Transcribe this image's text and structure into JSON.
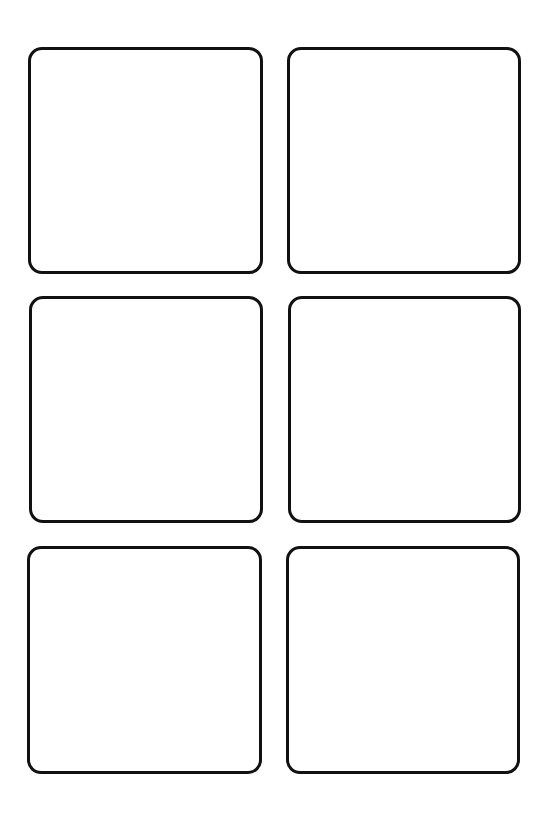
{
  "sheet": {
    "background": "#ffffff",
    "border_color": "#111111",
    "grid": {
      "rows": 3,
      "columns": 2
    },
    "cards": [
      {
        "row": 1,
        "column": 1,
        "label": ""
      },
      {
        "row": 1,
        "column": 2,
        "label": ""
      },
      {
        "row": 2,
        "column": 1,
        "label": ""
      },
      {
        "row": 2,
        "column": 2,
        "label": ""
      },
      {
        "row": 3,
        "column": 1,
        "label": ""
      },
      {
        "row": 3,
        "column": 2,
        "label": ""
      }
    ]
  }
}
